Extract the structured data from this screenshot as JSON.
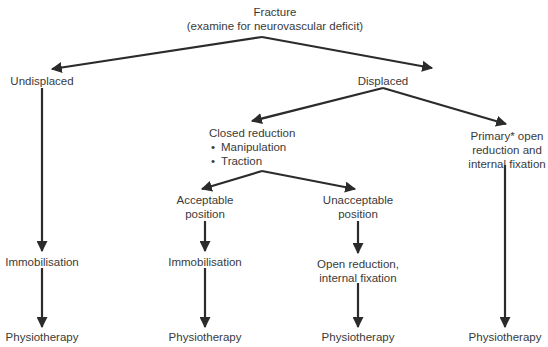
{
  "diagram": {
    "type": "flowchart",
    "root": {
      "title": "Fracture",
      "subtitle": "(examine for neurovascular deficit)"
    },
    "nodes": {
      "undisplaced": "Undisplaced",
      "displaced": "Displaced",
      "closed_reduction": {
        "title": "Closed reduction",
        "bullets": [
          "Manipulation",
          "Traction"
        ]
      },
      "primary_orif": [
        "Primary* open",
        "reduction and",
        "internal fixation"
      ],
      "acceptable": [
        "Acceptable",
        "position"
      ],
      "unacceptable": [
        "Unacceptable",
        "position"
      ],
      "immobilisation_1": "Immobilisation",
      "immobilisation_2": "Immobilisation",
      "orif": [
        "Open reduction,",
        "internal fixation"
      ],
      "physio_1": "Physiotherapy",
      "physio_2": "Physiotherapy",
      "physio_3": "Physiotherapy",
      "physio_4": "Physiotherapy"
    },
    "edges": [
      [
        "Fracture",
        "Undisplaced"
      ],
      [
        "Fracture",
        "Displaced"
      ],
      [
        "Displaced",
        "Closed reduction"
      ],
      [
        "Displaced",
        "Primary* open reduction and internal fixation"
      ],
      [
        "Closed reduction",
        "Acceptable position"
      ],
      [
        "Closed reduction",
        "Unacceptable position"
      ],
      [
        "Undisplaced",
        "Immobilisation"
      ],
      [
        "Acceptable position",
        "Immobilisation"
      ],
      [
        "Unacceptable position",
        "Open reduction, internal fixation"
      ],
      [
        "Immobilisation",
        "Physiotherapy"
      ],
      [
        "Immobilisation",
        "Physiotherapy"
      ],
      [
        "Open reduction, internal fixation",
        "Physiotherapy"
      ],
      [
        "Primary* open reduction and internal fixation",
        "Physiotherapy"
      ]
    ],
    "colors": {
      "line": "#2b2b2b",
      "text": "#3a3a3a",
      "background": "#ffffff"
    }
  }
}
